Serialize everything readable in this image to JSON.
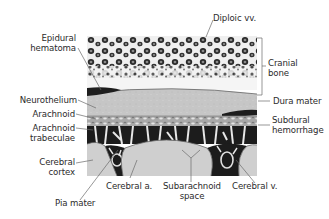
{
  "figure": {
    "type": "anatomical cross-section",
    "colors": {
      "bone_bg": "#f4f4f4",
      "bone_cells": "#2a2a2a",
      "dura": "#c9c9c9",
      "arachnoid": "#9a9a9a",
      "subarachnoid_dark": "#1c1c1c",
      "cortex": "#cfcfcf",
      "leader_line": "#666666"
    }
  },
  "labels": {
    "left": {
      "epidural_hematoma": [
        "Epidural",
        "hematoma"
      ],
      "neurothelium": "Neurothelium",
      "arachnoid": "Arachnoid",
      "arachnoid_trabeculae": [
        "Arachnoid",
        "trabeculae"
      ],
      "cerebral_cortex": [
        "Cerebral",
        "cortex"
      ],
      "pia_mater": "Pia mater"
    },
    "top": {
      "diploic_vv": "Diploic vv."
    },
    "right": {
      "cranial_bone": [
        "Cranial",
        "bone"
      ],
      "dura_mater": "Dura mater",
      "subdural_hemorrhage": [
        "Subdural",
        "hemorrhage"
      ]
    },
    "bottom": {
      "cerebral_a": "Cerebral a.",
      "subarachnoid_space": [
        "Subarachnoid",
        "space"
      ],
      "cerebral_v": "Cerebral v."
    }
  }
}
